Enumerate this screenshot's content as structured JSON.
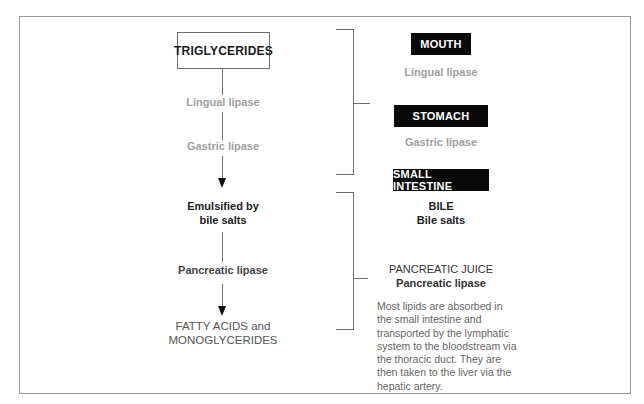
{
  "diagram": {
    "left_flow": {
      "start_box": "TRIGLYCERIDES",
      "step1": "Lingual lipase",
      "step2": "Gastric lipase",
      "step3_line1": "Emulsified by",
      "step3_line2": "bile salts",
      "step4": "Pancreatic lipase",
      "end_line1": "FATTY ACIDS and",
      "end_line2": "MONOGLYCERIDES"
    },
    "right_column": {
      "mouth": {
        "label": "MOUTH",
        "enzyme": "Lingual lipase"
      },
      "stomach": {
        "label": "STOMACH",
        "enzyme": "Gastric lipase"
      },
      "small_intestine": {
        "label": "SMALL INTESTINE"
      },
      "bile": {
        "title": "BILE",
        "subtitle": "Bile salts"
      },
      "pancreatic_juice": {
        "title": "PANCREATIC JUICE",
        "subtitle": "Pancreatic lipase"
      },
      "note": "Most lipids are absorbed in the small intestine and transported by the lymphatic system to the bloodstream via the thoracic duct. They are then taken to the liver via the hepatic artery."
    },
    "colors": {
      "organ_bg": "#0a0a0a",
      "organ_text": "#ffffff",
      "grey_text": "#a0a0a0",
      "dark_text": "#222222",
      "line": "#6e6e6e"
    }
  }
}
